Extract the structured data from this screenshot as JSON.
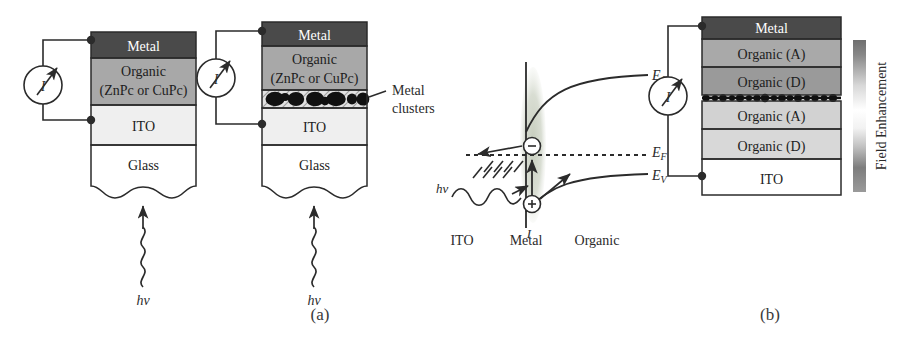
{
  "figure": {
    "domain": "scientific-diagram",
    "panels": [
      {
        "id": "a",
        "label": "(a)",
        "label_x": 320,
        "label_y": 320,
        "devices": [
          {
            "name": "plain-organic-photodetector",
            "x": 91,
            "y": 32,
            "w": 105,
            "h": 158,
            "meter": {
              "label": "I",
              "cx": 43,
              "cy": 85,
              "r": 19
            },
            "excitation": {
              "label": "hv",
              "x": 143,
              "y": 290
            },
            "layers": [
              {
                "name": "metal",
                "label": "Metal",
                "lines": [
                  "Metal"
                ],
                "y": 32,
                "h": 26,
                "fill": "#4a4a4a",
                "text": "#ffffff"
              },
              {
                "name": "organic",
                "label": "Organic (ZnPc or CuPc)",
                "lines": [
                  "Organic",
                  "(ZnPc or CuPc)"
                ],
                "y": 58,
                "h": 47,
                "fill": "#a8a8a8",
                "text": "#1d1d1d"
              },
              {
                "name": "ito",
                "label": "ITO",
                "lines": [
                  "ITO"
                ],
                "y": 105,
                "h": 40,
                "fill": "#efefef",
                "text": "#1d1d1d"
              },
              {
                "name": "glass",
                "label": "Glass",
                "lines": [
                  "Glass"
                ],
                "y": 145,
                "h": 45,
                "fill": "#ffffff",
                "text": "#1d1d1d"
              }
            ]
          },
          {
            "name": "metal-cluster-organic-photodetector",
            "x": 262,
            "y": 22,
            "w": 105,
            "h": 168,
            "meter": {
              "label": "I",
              "cx": 216,
              "cy": 78,
              "r": 19
            },
            "excitation": {
              "label": "hv",
              "x": 314,
              "y": 290
            },
            "callout": {
              "label": "Metal clusters",
              "lines": [
                "Metal",
                "clusters"
              ],
              "x": 392,
              "y": 86
            },
            "layers": [
              {
                "name": "metal",
                "label": "Metal",
                "lines": [
                  "Metal"
                ],
                "y": 22,
                "h": 24,
                "fill": "#4a4a4a",
                "text": "#ffffff"
              },
              {
                "name": "organic",
                "label": "Organic (ZnPc or CuPc)",
                "lines": [
                  "Organic",
                  "(ZnPc or CuPc)"
                ],
                "y": 46,
                "h": 44,
                "fill": "#a8a8a8",
                "text": "#1d1d1d"
              },
              {
                "name": "metal-clusters",
                "label": "",
                "lines": [],
                "y": 90,
                "h": 18,
                "fill": "#d9d9d9",
                "text": "#1d1d1d"
              },
              {
                "name": "ito",
                "label": "ITO",
                "lines": [
                  "ITO"
                ],
                "y": 108,
                "h": 37,
                "fill": "#efefef",
                "text": "#1d1d1d"
              },
              {
                "name": "glass",
                "label": "Glass",
                "lines": [
                  "Glass"
                ],
                "y": 145,
                "h": 45,
                "fill": "#ffffff",
                "text": "#1d1d1d"
              }
            ]
          }
        ],
        "band_diagram": {
          "name": "energy-band-diagram",
          "regions": [
            {
              "name": "ito-region",
              "label": "ITO",
              "x": 462,
              "y": 240
            },
            {
              "name": "metal-region",
              "label": "Metal",
              "x": 526,
              "y": 240
            },
            {
              "name": "organic-region",
              "label": "Organic",
              "x": 597,
              "y": 240
            }
          ],
          "levels": [
            {
              "name": "conduction-band",
              "label": "EC",
              "sub": "C",
              "x": 652,
              "y": 70
            },
            {
              "name": "fermi-level",
              "label": "EF",
              "sub": "F",
              "x": 652,
              "y": 152
            },
            {
              "name": "valence-band",
              "label": "EV",
              "sub": "V",
              "x": 652,
              "y": 176
            }
          ],
          "carriers": [
            {
              "name": "electron",
              "symbol": "−",
              "cx": 532,
              "cy": 146
            },
            {
              "name": "hole",
              "symbol": "+",
              "cx": 532,
              "cy": 204
            }
          ],
          "photon": {
            "label": "hv",
            "x": 440,
            "y": 186
          },
          "current": {
            "label": "I",
            "x": 529,
            "y": 232
          }
        }
      },
      {
        "id": "b",
        "label": "(b)",
        "label_x": 770,
        "label_y": 320,
        "devices": [
          {
            "name": "tandem-donor-acceptor-photodetector",
            "x": 702,
            "y": 17,
            "w": 139,
            "h": 178,
            "meter": {
              "label": "I",
              "cx": 668,
              "cy": 96,
              "r": 19
            },
            "layers": [
              {
                "name": "metal",
                "label": "Metal",
                "lines": [
                  "Metal"
                ],
                "y": 17,
                "h": 22,
                "fill": "#4a4a4a",
                "text": "#ffffff"
              },
              {
                "name": "organic-a-1",
                "label": "Organic (A)",
                "lines": [
                  "Organic (A)"
                ],
                "y": 39,
                "h": 28,
                "fill": "#a9a9a9",
                "text": "#1d1d1d"
              },
              {
                "name": "organic-d-1",
                "label": "Organic (D)",
                "lines": [
                  "Organic (D)"
                ],
                "y": 67,
                "h": 28,
                "fill": "#9a9a9a",
                "text": "#1d1d1d"
              },
              {
                "name": "metal-clusters-line",
                "label": "",
                "lines": [],
                "y": 95,
                "h": 6,
                "fill": "#c8c8c8",
                "text": "#1d1d1d"
              },
              {
                "name": "organic-a-2",
                "label": "Organic (A)",
                "lines": [
                  "Organic (A)"
                ],
                "y": 101,
                "h": 28,
                "fill": "#d2d2d2",
                "text": "#1d1d1d"
              },
              {
                "name": "organic-d-2",
                "label": "Organic (D)",
                "lines": [
                  "Organic (D)"
                ],
                "y": 129,
                "h": 30,
                "fill": "#d8d8d8",
                "text": "#1d1d1d"
              },
              {
                "name": "ito",
                "label": "ITO",
                "lines": [
                  "ITO"
                ],
                "y": 159,
                "h": 36,
                "fill": "#ffffff",
                "text": "#1d1d1d"
              }
            ]
          }
        ],
        "colorbar": {
          "name": "field-enhancement-colorbar",
          "label": "Field Enhancement",
          "x": 853,
          "y": 40,
          "w": 13,
          "h": 152,
          "label_x": 886,
          "label_y": 116
        }
      }
    ]
  },
  "colors": {
    "stroke": "#2b2b2b",
    "metal_fill": "#4a4a4a",
    "organic_fill": "#a8a8a8",
    "ito_fill": "#efefef",
    "glass_fill": "#ffffff",
    "cluster_fill": "#111111",
    "highlight_fill": "#c9cfc2"
  }
}
